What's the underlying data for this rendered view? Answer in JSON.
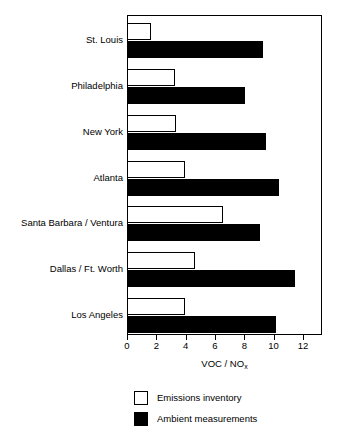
{
  "chart_data": {
    "type": "bar",
    "orientation": "horizontal",
    "title": "",
    "xlabel": "VOC / NO",
    "xlabel_sub": "x",
    "ylabel": "",
    "xlim": [
      0,
      13.3
    ],
    "xticks": [
      0,
      2,
      4,
      6,
      8,
      10,
      12
    ],
    "xticklabels": [
      "0",
      "2",
      "4",
      "6",
      "8",
      "10",
      "12"
    ],
    "grid": false,
    "legend_position": "below-plot",
    "categories": [
      "St. Louis",
      "Philadelphia",
      "New York",
      "Atlanta",
      "Santa Barbara / Ventura",
      "Dallas / Ft. Worth",
      "Los Angeles"
    ],
    "series": [
      {
        "name": "Emissions inventory",
        "color": "#ffffff",
        "edge_color": "#000000",
        "values": [
          1.6,
          3.2,
          3.3,
          3.9,
          6.5,
          4.6,
          3.9
        ]
      },
      {
        "name": "Ambient measurements",
        "color": "#000000",
        "edge_color": "#000000",
        "values": [
          9.2,
          8.0,
          9.4,
          10.3,
          9.0,
          11.4,
          10.1
        ]
      }
    ]
  },
  "legend": {
    "items": [
      {
        "label": "Emissions inventory",
        "swatch": "open"
      },
      {
        "label": "Ambient measurements",
        "swatch": "filled"
      }
    ]
  }
}
